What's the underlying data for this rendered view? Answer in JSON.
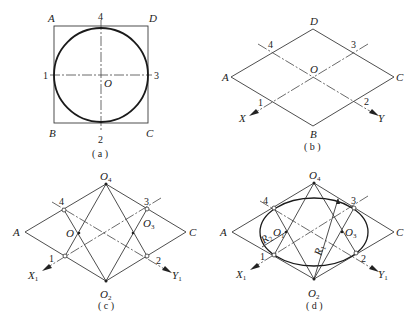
{
  "figure": {
    "panels": [
      {
        "id": "a",
        "caption": "( a )",
        "vertices": {
          "A": "A",
          "B": "B",
          "C": "C",
          "D": "D"
        },
        "center": "O",
        "points": [
          "1",
          "2",
          "3",
          "4"
        ],
        "description": "Circle inscribed in square with centerlines"
      },
      {
        "id": "b",
        "caption": "( b )",
        "vertices": {
          "A": "A",
          "B": "B",
          "C": "C",
          "D": "D"
        },
        "center": "O",
        "points": [
          "1",
          "2",
          "3",
          "4"
        ],
        "axes": {
          "x": "X",
          "y": "Y"
        },
        "description": "Isometric rhombus with axes"
      },
      {
        "id": "c",
        "caption": "( c )",
        "vertices": {
          "A": "A",
          "C": "C"
        },
        "centers": {
          "top": "O",
          "top_sub": "4",
          "bottom": "O",
          "bottom_sub": "2",
          "left": "O",
          "right": "O",
          "right_sub": "3"
        },
        "points": [
          "1",
          "2",
          "3",
          "4"
        ],
        "axes": {
          "x": "X",
          "x_sub": "1",
          "y": "Y",
          "y_sub": "1"
        },
        "description": "Construction of arc centers"
      },
      {
        "id": "d",
        "caption": "( d )",
        "vertices": {
          "A": "A",
          "C": "C"
        },
        "centers": {
          "top": "O",
          "top_sub": "4",
          "bottom": "O",
          "bottom_sub": "2",
          "left": "O",
          "left_sub": "1",
          "right": "O",
          "right_sub": "3"
        },
        "radii": {
          "r1": "R",
          "r1_sub": "1",
          "r2": "R",
          "r2_sub": "2"
        },
        "points": [
          "1",
          "2",
          "3",
          "4"
        ],
        "axes": {
          "x": "X",
          "x_sub": "1",
          "y": "Y",
          "y_sub": "1"
        },
        "description": "Four-center approximate ellipse"
      }
    ]
  }
}
